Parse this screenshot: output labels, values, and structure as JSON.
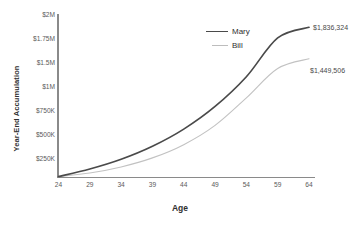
{
  "chart_data": {
    "type": "line",
    "title": "",
    "xlabel": "Age",
    "ylabel": "Year-End Accumulation",
    "xlim": [
      24,
      64
    ],
    "ylim": [
      0,
      2000000
    ],
    "grid": false,
    "legend_position": "upper-center",
    "x": [
      24,
      29,
      34,
      39,
      44,
      49,
      54,
      59,
      64
    ],
    "xtick_labels": [
      "24",
      "29",
      "34",
      "39",
      "44",
      "49",
      "54",
      "59",
      "64"
    ],
    "ytick_labels": [
      "$2M",
      "$1.75M",
      "$1.5M",
      "$1M",
      "$750K",
      "$500K",
      "$250K"
    ],
    "ytick_values": [
      2000000,
      1750000,
      1500000,
      1250000,
      1000000,
      750000,
      500000,
      250000
    ],
    "series": [
      {
        "name": "Mary",
        "color": "#4a4a4a",
        "width": 1.7,
        "end_label": "$1,836,324",
        "end_value": 1836324,
        "values": [
          0,
          92000,
          212000,
          372000,
          583000,
          862000,
          1228000,
          1706000,
          1836324
        ]
      },
      {
        "name": "Bill",
        "color": "#c2c2c2",
        "width": 1.1,
        "end_label": "$1,449,506",
        "end_value": 1449506,
        "values": [
          0,
          44000,
          118000,
          229000,
          392000,
          629000,
          968000,
          1330000,
          1449506
        ]
      }
    ]
  },
  "axes": {
    "x_title": "Age",
    "y_title": "Year-End Accumulation"
  },
  "legend": {
    "mary_label": "Mary",
    "bill_label": "Bill"
  },
  "annotations": {
    "mary_end": "$1,836,324",
    "bill_end": "$1,449,506"
  },
  "colors": {
    "mary_line": "#4a4a4a",
    "bill_line": "#c2c2c2",
    "axis": "#8a8a8a",
    "tick_text": "#5a5a5a",
    "title_text": "#2f2f2f",
    "background": "#ffffff"
  }
}
